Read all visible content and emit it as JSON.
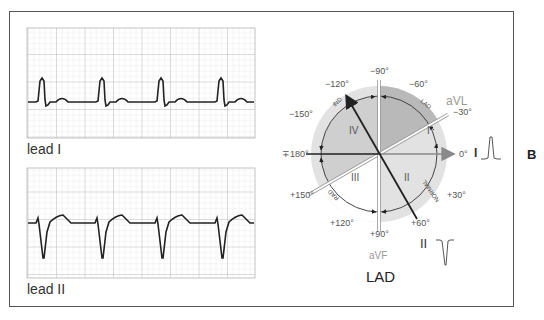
{
  "figure": {
    "panel_letter": "B",
    "caption": "LAD"
  },
  "ecg": {
    "strips": [
      {
        "label": "lead I",
        "morphology": "upright QRS, small T wave"
      },
      {
        "label": "lead II",
        "morphology": "deep negative QRS (rS), upsloping ST/T"
      }
    ],
    "grid_color": "#c8c8c8",
    "trace_color": "#222222"
  },
  "hexaxial": {
    "angles": {
      "m90": "−90°",
      "m120": "−120°",
      "m60": "−60°",
      "m150": "−150°",
      "m30": "−30°",
      "p180": "∓180°",
      "zero": "0°",
      "p150": "+150°",
      "p30": "+30°",
      "p120": "+120°",
      "p60": "+60°",
      "p90": "+90°"
    },
    "leads": {
      "aVL": "aVL",
      "aVF": "aVF",
      "I": "I",
      "II": "II"
    },
    "quadrants": {
      "q1": "I",
      "q2": "II",
      "q3": "III",
      "q4": "IV"
    },
    "arc_labels": {
      "ind": "IND",
      "lad": "LAD",
      "rad": "RAD",
      "normal": "NORMAL"
    },
    "colors": {
      "disk": "#e2e2e2",
      "quadrant_I": "#b9b9b9",
      "quadrant_IV": "#cfcfcf",
      "quadrant_III": "#ffffff",
      "axis_dark": "#222222",
      "axis_gray": "#8a8a8a",
      "lead_label_gray": "#9a9a9a"
    }
  }
}
